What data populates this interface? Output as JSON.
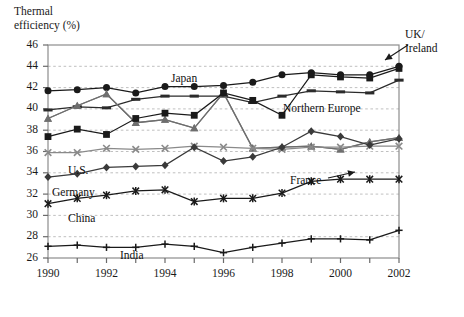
{
  "chart_data": {
    "type": "line",
    "title": "",
    "ylabel": "Thermal\nefficiency (%)",
    "xlabel": "",
    "ylim": [
      26,
      46
    ],
    "ytick_labels": [
      "26",
      "28",
      "30",
      "32",
      "34",
      "36",
      "38",
      "40",
      "42",
      "44",
      "46"
    ],
    "yticks": [
      26,
      28,
      30,
      32,
      34,
      36,
      38,
      40,
      42,
      44,
      46
    ],
    "xlim": [
      1990,
      2002
    ],
    "x": [
      1990,
      1991,
      1992,
      1993,
      1994,
      1995,
      1996,
      1997,
      1998,
      1999,
      2000,
      2001,
      2002
    ],
    "xtick_labels": [
      "1990",
      "1992",
      "1994",
      "1996",
      "1998",
      "2000",
      "2002"
    ],
    "xticks": [
      1990,
      1992,
      1994,
      1996,
      1998,
      2000,
      2002
    ],
    "grid": true,
    "grid_style": "dashed-horizontal",
    "legend": "inline-annotations",
    "series": [
      {
        "name": "Japan",
        "marker": "filled-circle",
        "color": "#1a1a1a",
        "values": [
          41.7,
          41.8,
          42.0,
          41.5,
          42.1,
          42.1,
          42.2,
          42.5,
          43.2,
          43.4,
          43.2,
          43.2,
          44.0
        ]
      },
      {
        "name": "Northern Europe",
        "marker": "dash",
        "color": "#2b2b2b",
        "values": [
          39.9,
          40.2,
          40.1,
          40.9,
          41.2,
          41.2,
          41.2,
          40.6,
          41.2,
          41.7,
          41.6,
          41.5,
          42.7
        ]
      },
      {
        "name": "UK/Ireland",
        "marker": "filled-triangle",
        "color": "#7d7d7d",
        "values": [
          39.1,
          40.3,
          41.4,
          38.7,
          39.0,
          38.2,
          41.5,
          36.3,
          36.4,
          36.5,
          36.2,
          36.9,
          37.3
        ]
      },
      {
        "name": "France",
        "marker": "filled-triangle-dark",
        "color": "#6e6e6e",
        "values": [
          39.1,
          40.3,
          41.4,
          38.7,
          39.0,
          38.2,
          41.5,
          36.3,
          36.4,
          36.5,
          36.2,
          36.9,
          37.3
        ]
      },
      {
        "name": "UK/Ireland-square",
        "marker": "filled-square",
        "color": "#1a1a1a",
        "values": [
          37.4,
          38.1,
          37.6,
          39.1,
          39.6,
          39.4,
          41.5,
          40.8,
          39.4,
          43.2,
          43.0,
          42.9,
          43.8
        ]
      },
      {
        "name": "U.S.",
        "marker": "x-cross",
        "color": "#8a8a8a",
        "values": [
          35.9,
          35.9,
          36.3,
          36.2,
          36.3,
          36.5,
          36.4,
          36.3,
          36.2,
          36.4,
          36.4,
          36.5,
          36.5
        ]
      },
      {
        "name": "Germany",
        "marker": "filled-diamond",
        "color": "#3a3a3a",
        "values": [
          33.6,
          33.9,
          34.5,
          34.6,
          34.7,
          36.4,
          35.1,
          35.5,
          36.4,
          37.9,
          37.4,
          36.6,
          37.2
        ]
      },
      {
        "name": "China",
        "marker": "asterisk",
        "color": "#1a1a1a",
        "values": [
          31.1,
          31.6,
          31.9,
          32.3,
          32.4,
          31.3,
          31.6,
          31.6,
          32.1,
          33.2,
          33.4,
          33.4,
          33.4
        ]
      },
      {
        "name": "India",
        "marker": "plus",
        "color": "#1a1a1a",
        "values": [
          27.1,
          27.2,
          27.0,
          27.0,
          27.3,
          27.1,
          26.5,
          27.0,
          27.4,
          27.8,
          27.8,
          27.7,
          28.6
        ]
      }
    ],
    "annotations": [
      {
        "text": "Japan",
        "name": "label-japan"
      },
      {
        "text": "Northern Europe",
        "name": "label-northern-europe"
      },
      {
        "text": "UK/\nIreland",
        "name": "label-uk-ireland"
      },
      {
        "text": "France",
        "name": "label-france"
      },
      {
        "text": "U.S.",
        "name": "label-us"
      },
      {
        "text": "Germany",
        "name": "label-germany"
      },
      {
        "text": "China",
        "name": "label-china"
      },
      {
        "text": "India",
        "name": "label-india"
      }
    ]
  }
}
